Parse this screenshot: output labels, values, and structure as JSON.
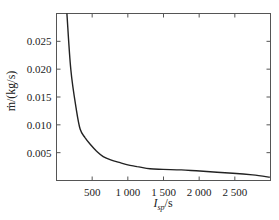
{
  "chart_data": {
    "type": "line",
    "title": "",
    "xlabel": "I_sp/s",
    "xlabel_main": "I",
    "xlabel_sub": "sp",
    "xlabel_unit": "/s",
    "ylabel": "ṁ/(kg/s)",
    "xlim": [
      0,
      3000
    ],
    "ylim": [
      0,
      0.03
    ],
    "xticks": [
      500,
      1000,
      1500,
      2000,
      2500
    ],
    "xtick_labels": [
      "500",
      "1 000",
      "1 500",
      "2 000",
      "2 500"
    ],
    "yticks": [
      0.005,
      0.01,
      0.015,
      0.02,
      0.025
    ],
    "ytick_labels": [
      "0.005",
      "0.010",
      "0.015",
      "0.020",
      "0.025"
    ],
    "grid": false,
    "legend": null,
    "series": [
      {
        "name": "mass flow rate",
        "color": "#222222",
        "x": [
          146,
          200,
          276,
          332,
          400,
          472,
          560,
          654,
          760,
          892,
          1000,
          1130,
          1311,
          1493,
          1750,
          2010,
          2250,
          2472,
          2750,
          2990
        ],
        "y": [
          0.0304,
          0.02,
          0.0129,
          0.0092,
          0.0077,
          0.0065,
          0.0053,
          0.0043,
          0.0037,
          0.0032,
          0.0028,
          0.0025,
          0.0021,
          0.002,
          0.0019,
          0.0017,
          0.0015,
          0.0013,
          0.001,
          0.0006
        ]
      }
    ]
  }
}
